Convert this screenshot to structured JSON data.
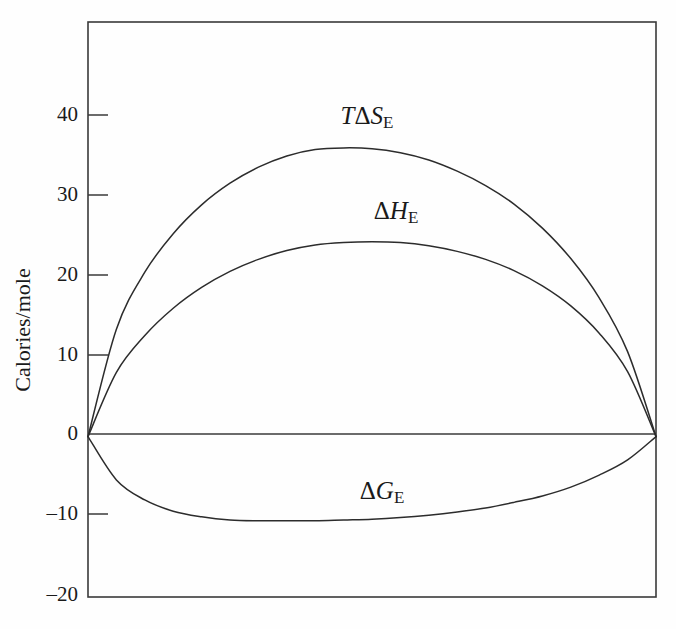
{
  "figure": {
    "background_color": "#fefefe",
    "line_color": "#2c2c2c",
    "axis_color": "#3a3a3a"
  },
  "axes": {
    "ylabel": "Calories/mole",
    "ytick_labels": [
      "40",
      "30",
      "20",
      "10",
      "0",
      "–10",
      "–20"
    ],
    "xtick_labels": []
  },
  "labels": {
    "tds": {
      "pre": "T",
      "delta": "Δ",
      "sym": "S",
      "sub": "E"
    },
    "dh": {
      "pre": "",
      "delta": "Δ",
      "sym": "H",
      "sub": "E"
    },
    "dg": {
      "pre": "",
      "delta": "Δ",
      "sym": "G",
      "sub": "E"
    }
  },
  "chart_data": {
    "type": "line",
    "title": "",
    "xlabel": "",
    "ylabel": "Calories/mole",
    "xlim": [
      0,
      1
    ],
    "ylim": [
      -20,
      51.7
    ],
    "yticks": [
      40,
      30,
      20,
      10,
      0,
      -10,
      -20
    ],
    "ytick_labels": [
      "40",
      "30",
      "20",
      "10",
      "0",
      "–10",
      "–20"
    ],
    "xticks": [],
    "grid": false,
    "legend": "inline-annotations",
    "annotations": [
      {
        "text": "TΔS_E",
        "x": 0.42,
        "y": 41.5
      },
      {
        "text": "ΔH_E",
        "x": 0.51,
        "y": 29.5
      },
      {
        "text": "ΔG_E",
        "x": 0.47,
        "y": -6.0
      }
    ],
    "x": [
      0.0,
      0.05,
      0.1,
      0.15,
      0.2,
      0.25,
      0.3,
      0.35,
      0.4,
      0.45,
      0.5,
      0.55,
      0.6,
      0.65,
      0.7,
      0.75,
      0.8,
      0.85,
      0.9,
      0.95,
      1.0
    ],
    "series": [
      {
        "name": "TΔS_E",
        "peak_value": 36.0,
        "peak_x": 0.52,
        "values": [
          0.0,
          13.4,
          20.5,
          25.3,
          28.9,
          31.6,
          33.6,
          35.0,
          35.8,
          36.0,
          35.9,
          35.4,
          34.5,
          33.1,
          31.3,
          29.0,
          26.0,
          22.2,
          17.3,
          10.6,
          0.0
        ]
      },
      {
        "name": "ΔH_E",
        "peak_value": 24.3,
        "peak_x": 0.55,
        "values": [
          0.0,
          8.0,
          12.6,
          16.0,
          18.6,
          20.6,
          22.1,
          23.2,
          23.9,
          24.2,
          24.3,
          24.2,
          23.8,
          23.1,
          22.1,
          20.7,
          18.8,
          16.3,
          12.9,
          8.1,
          0.0
        ]
      },
      {
        "name": "ΔG_E",
        "peak_value": -10.5,
        "peak_x": 0.53,
        "values": [
          0.0,
          -5.4,
          -7.9,
          -9.3,
          -10.0,
          -10.4,
          -10.5,
          -10.5,
          -10.5,
          -10.4,
          -10.3,
          -10.1,
          -9.8,
          -9.4,
          -8.9,
          -8.2,
          -7.4,
          -6.3,
          -4.8,
          -2.9,
          0.0
        ]
      }
    ]
  }
}
